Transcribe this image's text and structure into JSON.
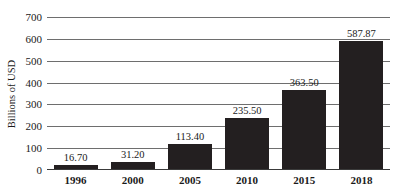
{
  "chart_data": {
    "type": "bar",
    "title": "",
    "xlabel": "",
    "ylabel": "Billions of USD",
    "categories": [
      "1996",
      "2000",
      "2005",
      "2010",
      "2015",
      "2018"
    ],
    "values": [
      16.7,
      31.2,
      113.4,
      235.5,
      363.5,
      587.87
    ],
    "value_labels": [
      "16.70",
      "31.20",
      "113.40",
      "235.50",
      "363.50",
      "587.87"
    ],
    "ylim": [
      0,
      700
    ],
    "yticks": [
      0,
      100,
      200,
      300,
      400,
      500,
      600,
      700
    ],
    "ytick_labels": [
      "0",
      "100",
      "200",
      "300",
      "400",
      "500",
      "600",
      "700"
    ],
    "grid": true,
    "grid_axis": "y",
    "legend": false,
    "legend_position": "none",
    "bar_color": "#231f20",
    "gridline_color": "#6e6e6e",
    "axis_color": "#3a3a3a",
    "background_color": "#ffffff",
    "text_color": "#1a1a1a"
  }
}
